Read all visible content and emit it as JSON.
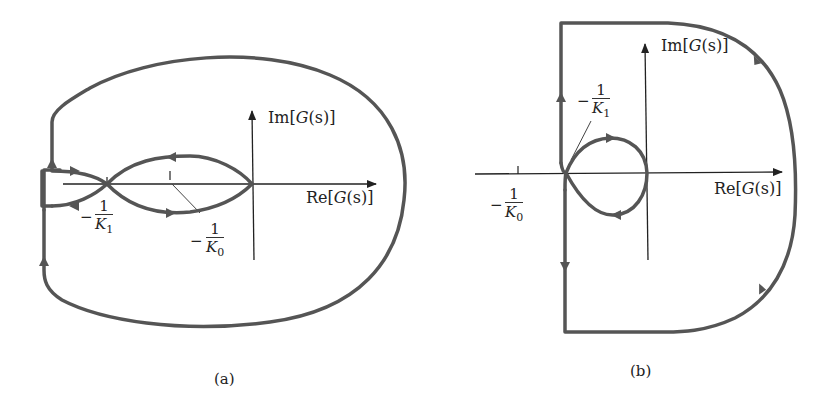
{
  "figure": {
    "panels": [
      {
        "id": "a",
        "caption": "(a)",
        "axes": {
          "x_label_pre": "Re[",
          "x_label_fn": "G",
          "x_label_arg": "(s)",
          "x_label_post": "]",
          "y_label_pre": "Im[",
          "y_label_fn": "G",
          "y_label_arg": "(s)",
          "y_label_post": "]"
        },
        "markers": [
          {
            "sign": "−",
            "num": "1",
            "den": "K",
            "sub": "1"
          },
          {
            "sign": "−",
            "num": "1",
            "den": "K",
            "sub": "0"
          }
        ]
      },
      {
        "id": "b",
        "caption": "(b)",
        "axes": {
          "x_label_pre": "Re[",
          "x_label_fn": "G",
          "x_label_arg": "(s)",
          "x_label_post": "]",
          "y_label_pre": "Im[",
          "y_label_fn": "G",
          "y_label_arg": "(s)",
          "y_label_post": "]"
        },
        "markers": [
          {
            "sign": "−",
            "num": "1",
            "den": "K",
            "sub": "1"
          },
          {
            "sign": "−",
            "num": "1",
            "den": "K",
            "sub": "0"
          }
        ]
      }
    ],
    "colors": {
      "contour": "#555555",
      "axis": "#222222",
      "text": "#222222"
    }
  }
}
